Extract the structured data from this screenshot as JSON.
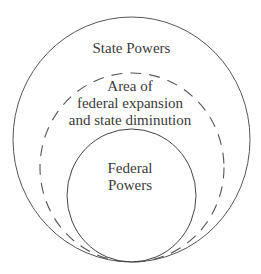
{
  "diagram": {
    "type": "nested-circles",
    "regions": [
      {
        "id": "outer",
        "label": "State Powers",
        "stroke": "solid"
      },
      {
        "id": "middle",
        "label_lines": [
          "Area of",
          "federal expansion",
          "and state diminution"
        ],
        "stroke": "dashed"
      },
      {
        "id": "inner",
        "label_lines": [
          "Federal",
          "Powers"
        ],
        "stroke": "solid"
      }
    ],
    "colors": {
      "stroke": "#555555",
      "text": "#3a3a3a",
      "background": "#ffffff"
    }
  }
}
